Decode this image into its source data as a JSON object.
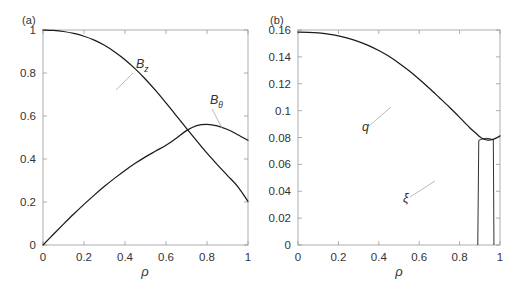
{
  "figure": {
    "panels": [
      {
        "tag": "(a)",
        "xlabel": "ρ",
        "ylabel": "",
        "xticks": [
          "0",
          "0.2",
          "0.4",
          "0.6",
          "0.8",
          "1"
        ],
        "xtickvals": [
          0,
          0.2,
          0.4,
          0.6,
          0.8,
          1
        ],
        "yticks": [
          "0",
          "0.2",
          "0.4",
          "0.6",
          "0.8",
          "1"
        ],
        "ytickvals": [
          0,
          0.2,
          0.4,
          0.6,
          0.8,
          1
        ],
        "xlim": [
          0,
          1
        ],
        "ylim": [
          0,
          1
        ],
        "annotations": [
          {
            "name": "Bz",
            "base": "B",
            "sub": "z"
          },
          {
            "name": "Btheta",
            "base": "B",
            "sub": "θ"
          }
        ]
      },
      {
        "tag": "(b)",
        "xlabel": "ρ",
        "ylabel": "",
        "xticks": [
          "0",
          "0.2",
          "0.4",
          "0.6",
          "0.8",
          "1"
        ],
        "xtickvals": [
          0,
          0.2,
          0.4,
          0.6,
          0.8,
          1
        ],
        "yticks": [
          "0",
          "0.02",
          "0.04",
          "0.06",
          "0.08",
          "0.1",
          "0.12",
          "0.14",
          "0.16"
        ],
        "ytickvals": [
          0,
          0.02,
          0.04,
          0.06,
          0.08,
          0.1,
          0.12,
          0.14,
          0.16
        ],
        "xlim": [
          0,
          1
        ],
        "ylim": [
          0,
          0.16
        ],
        "annotations": [
          {
            "name": "q",
            "base": "q",
            "sub": ""
          },
          {
            "name": "xi",
            "base": "ξ",
            "sub": ""
          }
        ]
      }
    ]
  },
  "chart_data": [
    {
      "type": "line",
      "panel": "(a)",
      "title": "",
      "xlabel": "ρ",
      "ylabel": "",
      "xlim": [
        0,
        1
      ],
      "ylim": [
        0,
        1
      ],
      "grid": false,
      "legend": "inline-annotations",
      "x": [
        0,
        0.05,
        0.1,
        0.15,
        0.2,
        0.25,
        0.3,
        0.35,
        0.4,
        0.45,
        0.5,
        0.55,
        0.6,
        0.65,
        0.7,
        0.75,
        0.8,
        0.85,
        0.9,
        0.95,
        1
      ],
      "series": [
        {
          "name": "B_z",
          "label": "B_z",
          "color": "#1a1a1a",
          "values": [
            1.0,
            0.998,
            0.993,
            0.984,
            0.971,
            0.953,
            0.929,
            0.898,
            0.862,
            0.819,
            0.771,
            0.718,
            0.661,
            0.602,
            0.542,
            0.484,
            0.427,
            0.374,
            0.323,
            0.272,
            0.203
          ]
        },
        {
          "name": "B_theta",
          "label": "B_θ",
          "color": "#1a1a1a",
          "values": [
            0.0,
            0.049,
            0.097,
            0.144,
            0.189,
            0.232,
            0.273,
            0.311,
            0.347,
            0.38,
            0.41,
            0.437,
            0.464,
            0.497,
            0.532,
            0.555,
            0.561,
            0.554,
            0.537,
            0.513,
            0.487
          ]
        }
      ]
    },
    {
      "type": "line",
      "panel": "(b)",
      "title": "",
      "xlabel": "ρ",
      "ylabel": "",
      "xlim": [
        0,
        1
      ],
      "ylim": [
        0,
        0.16
      ],
      "grid": false,
      "legend": "inline-annotations",
      "x": [
        0,
        0.05,
        0.1,
        0.15,
        0.2,
        0.25,
        0.3,
        0.35,
        0.4,
        0.45,
        0.5,
        0.55,
        0.6,
        0.65,
        0.7,
        0.75,
        0.8,
        0.85,
        0.88,
        0.9,
        0.92,
        0.94,
        0.96,
        0.98,
        1
      ],
      "series": [
        {
          "name": "q",
          "label": "q",
          "color": "#1a1a1a",
          "values": [
            0.1585,
            0.1583,
            0.1578,
            0.1569,
            0.1556,
            0.1538,
            0.1514,
            0.1484,
            0.1447,
            0.1404,
            0.1353,
            0.1296,
            0.1233,
            0.1166,
            0.1096,
            0.1025,
            0.095,
            0.0873,
            0.0833,
            0.0805,
            0.0787,
            0.0781,
            0.0784,
            0.0795,
            0.0812
          ]
        },
        {
          "name": "xi",
          "label": "ξ",
          "color": "#1a1a1a",
          "description": "narrow near-vertical displacement eigenfunction spanning rho 0.89 to 0.97, rising from 0 at the axis to a flat top near 0.079",
          "x_left": 0.89,
          "x_right": 0.97,
          "top_value": 0.079
        }
      ]
    }
  ]
}
